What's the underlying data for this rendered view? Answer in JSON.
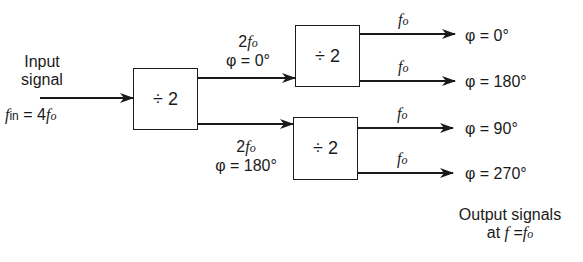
{
  "diagram": {
    "input": {
      "label_line1": "Input",
      "label_line2": "signal",
      "freq_symbol": "f",
      "freq_sub": "in",
      "freq_eq": " = 4",
      "freq_fo": "f",
      "freq_fo_sub": "o"
    },
    "blocks": [
      {
        "id": "divider-1",
        "label": "÷ 2"
      },
      {
        "id": "divider-2",
        "label": "÷ 2"
      },
      {
        "id": "divider-3",
        "label": "÷ 2"
      }
    ],
    "intermediate": [
      {
        "freq_coef": "2",
        "freq": "f",
        "freq_sub": "o",
        "phase": "φ  = 0°"
      },
      {
        "freq_coef": "2",
        "freq": "f",
        "freq_sub": "o",
        "phase": "φ  = 180°"
      }
    ],
    "outputs": [
      {
        "freq": "f",
        "freq_sub": "o",
        "phase": "φ  = 0°"
      },
      {
        "freq": "f",
        "freq_sub": "o",
        "phase": "φ  = 180°"
      },
      {
        "freq": "f",
        "freq_sub": "o",
        "phase": "φ  = 90°"
      },
      {
        "freq": "f",
        "freq_sub": "o",
        "phase": "φ  = 270°"
      }
    ],
    "output_caption": {
      "line1": "Output signals",
      "line2_prefix": "at ",
      "line2_f": "f",
      "line2_eq": " =",
      "line2_fo": "f",
      "line2_fo_sub": "o"
    }
  }
}
